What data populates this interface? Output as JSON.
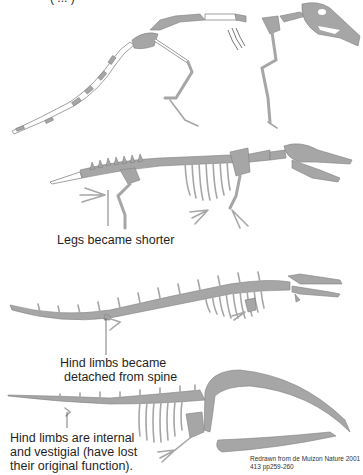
{
  "figure": {
    "top_partial_caption": "( ... )",
    "bone_color": "#a6a6a6",
    "bone_stroke": "#7a7a7a",
    "reconstructed_bone_color": "#ffffff",
    "stages": [
      {
        "id": "pakicetus",
        "description": "Four-legged terrestrial ancestor with long tail and long legs",
        "label": ""
      },
      {
        "id": "ambulocetus",
        "description": "Amphibious form with shorter legs",
        "label": "Legs became shorter"
      },
      {
        "id": "basilosaurus",
        "description": "Elongated fully aquatic form with tiny hind limbs",
        "label_line1": "Hind limbs became",
        "label_line2": "detached from spine"
      },
      {
        "id": "modern-whale",
        "description": "Modern baleen whale with large arched jaws",
        "label_line1": "Hind limbs are internal",
        "label_line2": "and vestigial (have lost",
        "label_line3": "their original function)."
      }
    ],
    "credit_line1": "Redrawn from de Muizon Nature 2001",
    "credit_line2": "413 pp259-260"
  }
}
